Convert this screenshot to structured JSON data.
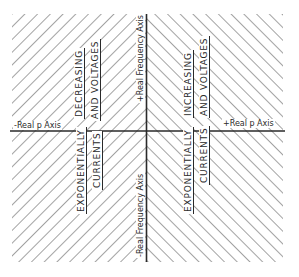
{
  "diagram": {
    "colors": {
      "ink": "#2a2a2a",
      "hatch": "#555555",
      "background": "#ffffff"
    },
    "axes": {
      "horizontal": {
        "negative_label": "-Real p Axis",
        "positive_label": "+Real p Axis"
      },
      "vertical": {
        "positive_label": "+Real Frequency Axis",
        "negative_label": "-Real Frequency Axis"
      }
    },
    "regions": {
      "left_half": {
        "hatch_direction": "backslash",
        "top": {
          "line1": "DECREASING",
          "line2": "AND VOLTAGES"
        },
        "bottom": {
          "line1": "EXPONENTIALLY",
          "line2": "CURRENTS"
        }
      },
      "right_half": {
        "hatch_direction": "slash",
        "top": {
          "line1": "INCREASING",
          "line2": "AND VOLTAGES"
        },
        "bottom": {
          "line1": "EXPONENTIALLY",
          "line2": "CURRENTS"
        }
      }
    }
  }
}
